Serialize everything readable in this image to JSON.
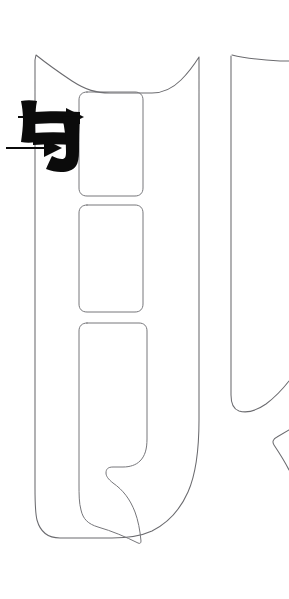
{
  "figure": {
    "title": "Vehicle pillar trim panel outline drawing",
    "background_color": "#ffffff",
    "outline_color": "#6b6b6f",
    "annotation_color": "#0b0b0b",
    "width": 289,
    "height": 599
  },
  "shapes": {
    "main_panel_label": "main-pillar-panel-outline",
    "right_panel_label": "adjacent-panel-outline-cropped",
    "cutout_1_label": "upper-rectangular-cutout",
    "cutout_2_label": "middle-rectangular-cutout",
    "cutout_3_label": "lower-hooked-cutout"
  },
  "annotations": {
    "glyph": {
      "name": "brush-stroke-glyph",
      "text": "与"
    },
    "leaders": [
      {
        "name": "upper-callout-arrow",
        "direction": "right",
        "tip_x": 84,
        "tip_y": 117
      },
      {
        "name": "lower-callout-arrow",
        "direction": "right",
        "tip_x": 62,
        "tip_y": 148
      }
    ]
  }
}
